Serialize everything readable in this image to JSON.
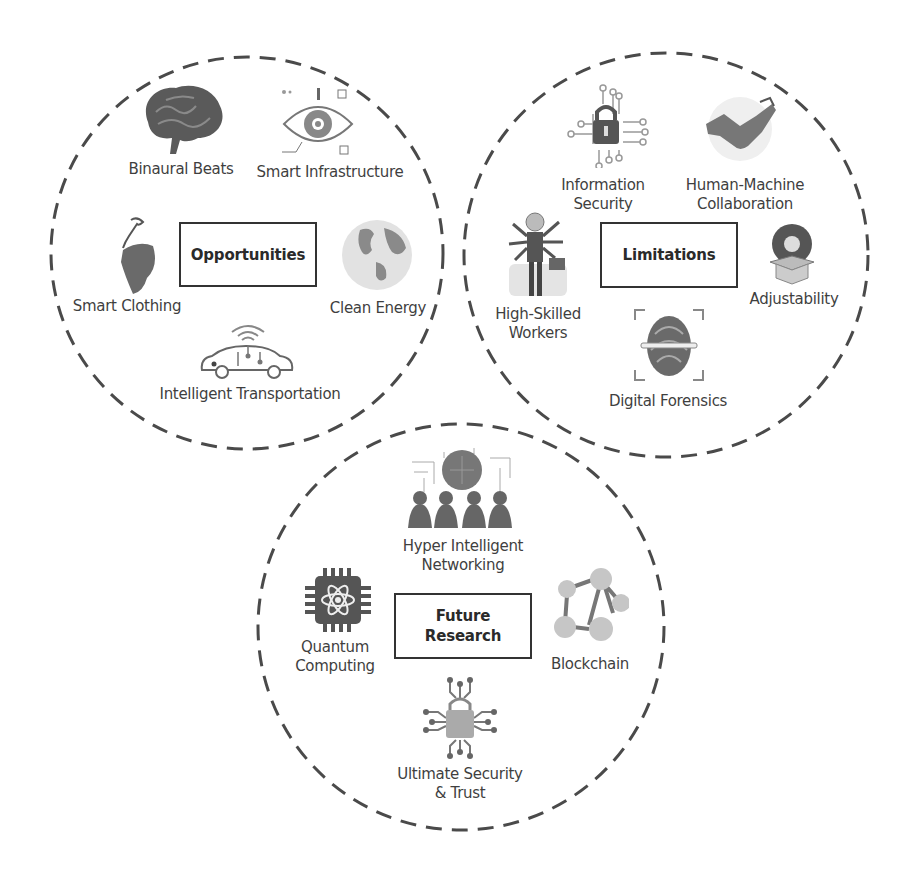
{
  "diagram": {
    "colors": {
      "stroke": "#4a4a4a",
      "text": "#3f3f3f",
      "box_border": "#333333",
      "icon_fill": "#6e6e6e"
    },
    "circles": [
      {
        "id": "opportunities",
        "title": "Opportunities",
        "items": [
          {
            "label": "Binaural Beats",
            "icon": "brain-icon"
          },
          {
            "label": "Smart Infrastructure",
            "icon": "eye-tech-icon"
          },
          {
            "label": "Smart Clothing",
            "icon": "dress-icon"
          },
          {
            "label": "Clean Energy",
            "icon": "globe-icon"
          },
          {
            "label": "Intelligent Transportation",
            "icon": "connected-car-icon"
          }
        ]
      },
      {
        "id": "limitations",
        "title": "Limitations",
        "items": [
          {
            "label": "Information Security",
            "line1": "Information",
            "line2": "Security",
            "icon": "circuit-lock-icon"
          },
          {
            "label": "Human-Machine Collaboration",
            "line1": "Human-Machine",
            "line2": "Collaboration",
            "icon": "handshake-robot-icon"
          },
          {
            "label": "High-Skilled Workers",
            "line1": "High-Skilled",
            "line2": "Workers",
            "icon": "multi-arm-worker-icon"
          },
          {
            "label": "Adjustability",
            "icon": "box-sphere-icon"
          },
          {
            "label": "Digital Forensics",
            "icon": "fingerprint-scan-icon"
          }
        ]
      },
      {
        "id": "future-research",
        "title": "Future Research",
        "title_line1": "Future",
        "title_line2": "Research",
        "items": [
          {
            "label": "Hyper Intelligent Networking",
            "line1": "Hyper Intelligent",
            "line2": "Networking",
            "icon": "network-people-icon"
          },
          {
            "label": "Quantum Computing",
            "line1": "Quantum",
            "line2": "Computing",
            "icon": "quantum-chip-icon"
          },
          {
            "label": "Blockchain",
            "icon": "blockchain-nodes-icon"
          },
          {
            "label": "Ultimate Security & Trust",
            "line1": "Ultimate Security",
            "line2": "& Trust",
            "icon": "circuit-lock-icon"
          }
        ]
      }
    ]
  }
}
